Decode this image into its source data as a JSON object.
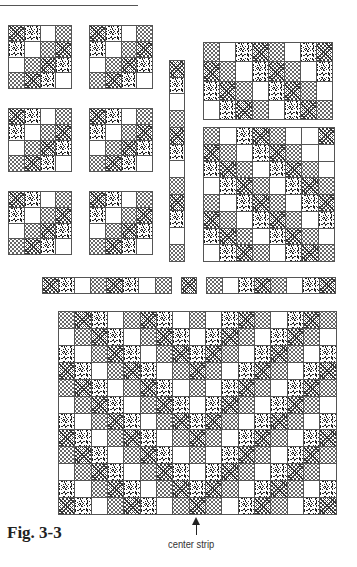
{
  "figure": {
    "label": "Fig. 3-3",
    "annotation": "center strip",
    "legend": {
      "C": "circles-fabric",
      "D": "dark-crosshatch-fabric",
      "S": "scattered-strokes-fabric",
      "W": "plain-white-fabric"
    }
  },
  "blocks": [
    {
      "name": "block-4x4-r1-c1",
      "left": 8,
      "top": 25,
      "cols": 4,
      "rows": 4,
      "cell": 16,
      "cells": [
        [
          "D",
          "S",
          "W",
          "C"
        ],
        [
          "S",
          "W",
          "C",
          "D"
        ],
        [
          "W",
          "C",
          "D",
          "S"
        ],
        [
          "C",
          "D",
          "S",
          "W"
        ]
      ]
    },
    {
      "name": "block-4x4-r1-c2",
      "left": 89,
      "top": 25,
      "cols": 4,
      "rows": 4,
      "cell": 16,
      "cells": [
        [
          "D",
          "S",
          "W",
          "C"
        ],
        [
          "S",
          "W",
          "C",
          "D"
        ],
        [
          "W",
          "C",
          "D",
          "S"
        ],
        [
          "C",
          "D",
          "S",
          "W"
        ]
      ]
    },
    {
      "name": "block-4x4-r2-c1",
      "left": 8,
      "top": 108,
      "cols": 4,
      "rows": 4,
      "cell": 16,
      "cells": [
        [
          "D",
          "S",
          "W",
          "C"
        ],
        [
          "S",
          "W",
          "C",
          "D"
        ],
        [
          "W",
          "C",
          "D",
          "S"
        ],
        [
          "C",
          "D",
          "S",
          "W"
        ]
      ]
    },
    {
      "name": "block-4x4-r2-c2",
      "left": 89,
      "top": 108,
      "cols": 4,
      "rows": 4,
      "cell": 16,
      "cells": [
        [
          "D",
          "S",
          "W",
          "C"
        ],
        [
          "S",
          "W",
          "C",
          "D"
        ],
        [
          "W",
          "C",
          "D",
          "S"
        ],
        [
          "C",
          "D",
          "S",
          "W"
        ]
      ]
    },
    {
      "name": "block-4x4-r3-c1",
      "left": 8,
      "top": 191,
      "cols": 4,
      "rows": 4,
      "cell": 16,
      "cells": [
        [
          "D",
          "S",
          "W",
          "C"
        ],
        [
          "S",
          "W",
          "C",
          "D"
        ],
        [
          "W",
          "C",
          "D",
          "S"
        ],
        [
          "C",
          "D",
          "S",
          "W"
        ]
      ]
    },
    {
      "name": "block-4x4-r3-c2",
      "left": 89,
      "top": 191,
      "cols": 4,
      "rows": 4,
      "cell": 16,
      "cells": [
        [
          "D",
          "S",
          "W",
          "C"
        ],
        [
          "S",
          "W",
          "C",
          "D"
        ],
        [
          "W",
          "C",
          "D",
          "S"
        ],
        [
          "C",
          "D",
          "S",
          "W"
        ]
      ]
    },
    {
      "name": "vertical-strip",
      "left": 169,
      "top": 60,
      "cols": 1,
      "rows": 12,
      "cell": 16.8,
      "cellw": 16,
      "cells": [
        [
          "D"
        ],
        [
          "S"
        ],
        [
          "W"
        ],
        [
          "C"
        ],
        [
          "D"
        ],
        [
          "S"
        ],
        [
          "W"
        ],
        [
          "C"
        ],
        [
          "D"
        ],
        [
          "S"
        ],
        [
          "W"
        ],
        [
          "C"
        ]
      ]
    },
    {
      "name": "block-8x4-top-right",
      "left": 203,
      "top": 42,
      "cols": 8,
      "rows": 4,
      "cell": 16.3,
      "cellh": 19.5,
      "cells": [
        [
          "C",
          "W",
          "S",
          "D",
          "C",
          "W",
          "S",
          "D"
        ],
        [
          "D",
          "C",
          "W",
          "S",
          "D",
          "C",
          "W",
          "S"
        ],
        [
          "S",
          "D",
          "C",
          "W",
          "S",
          "D",
          "C",
          "W"
        ],
        [
          "W",
          "S",
          "D",
          "C",
          "W",
          "S",
          "D",
          "C"
        ]
      ]
    },
    {
      "name": "block-8x8-right",
      "left": 203,
      "top": 127,
      "cols": 8,
      "rows": 8,
      "cell": 16.5,
      "cellh": 16.9,
      "cells": [
        [
          "C",
          "W",
          "S",
          "D",
          "C",
          "W",
          "W",
          "D"
        ],
        [
          "D",
          "C",
          "W",
          "S",
          "D",
          "C",
          "W",
          "W"
        ],
        [
          "S",
          "D",
          "C",
          "W",
          "S",
          "D",
          "C",
          "W"
        ],
        [
          "W",
          "S",
          "D",
          "C",
          "W",
          "S",
          "D",
          "C"
        ],
        [
          "C",
          "W",
          "S",
          "D",
          "C",
          "W",
          "S",
          "D"
        ],
        [
          "D",
          "C",
          "W",
          "S",
          "D",
          "C",
          "W",
          "S"
        ],
        [
          "S",
          "D",
          "C",
          "W",
          "S",
          "D",
          "C",
          "W"
        ],
        [
          "W",
          "S",
          "D",
          "C",
          "W",
          "S",
          "D",
          "C"
        ]
      ]
    },
    {
      "name": "horizontal-strip-left",
      "left": 42,
      "top": 277,
      "cols": 8,
      "rows": 1,
      "cell": 16.2,
      "cellh": 17,
      "cells": [
        [
          "D",
          "S",
          "W",
          "C",
          "D",
          "S",
          "W",
          "C"
        ]
      ]
    },
    {
      "name": "horizontal-strip-center",
      "left": 181,
      "top": 277,
      "cols": 1,
      "rows": 1,
      "cell": 16,
      "cellh": 17,
      "cells": [
        [
          "D"
        ]
      ]
    },
    {
      "name": "horizontal-strip-right",
      "left": 206,
      "top": 277,
      "cols": 8,
      "rows": 1,
      "cell": 16.2,
      "cellh": 17,
      "cells": [
        [
          "C",
          "W",
          "S",
          "D",
          "C",
          "W",
          "S",
          "D"
        ]
      ]
    },
    {
      "name": "assembled-quilt",
      "left": 58,
      "top": 311,
      "cols": 17,
      "rows": 12,
      "cell": 16.4,
      "cellh": 17,
      "cells": [
        [
          "C",
          "D",
          "S",
          "W",
          "C",
          "D",
          "S",
          "W",
          "C",
          "W",
          "S",
          "D",
          "C",
          "W",
          "S",
          "D",
          "C"
        ],
        [
          "W",
          "C",
          "D",
          "S",
          "W",
          "C",
          "D",
          "S",
          "W",
          "S",
          "D",
          "C",
          "W",
          "S",
          "D",
          "C",
          "W"
        ],
        [
          "S",
          "W",
          "C",
          "D",
          "S",
          "W",
          "C",
          "D",
          "S",
          "D",
          "C",
          "W",
          "S",
          "D",
          "C",
          "W",
          "S"
        ],
        [
          "D",
          "S",
          "W",
          "C",
          "D",
          "S",
          "W",
          "C",
          "D",
          "C",
          "W",
          "S",
          "D",
          "C",
          "W",
          "S",
          "D"
        ],
        [
          "C",
          "D",
          "S",
          "W",
          "C",
          "D",
          "S",
          "W",
          "C",
          "W",
          "S",
          "D",
          "C",
          "W",
          "S",
          "D",
          "C"
        ],
        [
          "W",
          "C",
          "D",
          "S",
          "W",
          "C",
          "D",
          "S",
          "W",
          "S",
          "D",
          "C",
          "W",
          "S",
          "D",
          "C",
          "W"
        ],
        [
          "S",
          "W",
          "C",
          "D",
          "S",
          "W",
          "C",
          "D",
          "S",
          "D",
          "C",
          "W",
          "S",
          "D",
          "C",
          "W",
          "S"
        ],
        [
          "D",
          "S",
          "W",
          "C",
          "D",
          "S",
          "W",
          "C",
          "D",
          "C",
          "W",
          "S",
          "D",
          "C",
          "W",
          "S",
          "D"
        ],
        [
          "C",
          "D",
          "S",
          "W",
          "C",
          "D",
          "S",
          "W",
          "C",
          "W",
          "S",
          "D",
          "C",
          "W",
          "S",
          "D",
          "C"
        ],
        [
          "W",
          "C",
          "D",
          "S",
          "W",
          "C",
          "D",
          "S",
          "W",
          "S",
          "D",
          "C",
          "W",
          "S",
          "D",
          "C",
          "W"
        ],
        [
          "S",
          "W",
          "C",
          "D",
          "S",
          "W",
          "C",
          "D",
          "S",
          "D",
          "C",
          "W",
          "S",
          "D",
          "C",
          "W",
          "S"
        ],
        [
          "D",
          "S",
          "W",
          "C",
          "D",
          "S",
          "W",
          "C",
          "D",
          "C",
          "W",
          "S",
          "D",
          "C",
          "W",
          "S",
          "D"
        ]
      ]
    }
  ]
}
